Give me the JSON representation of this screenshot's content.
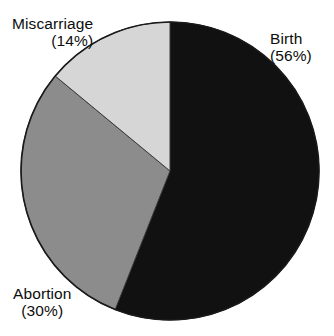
{
  "figure": {
    "background_color": "#ffffff",
    "outline_color": "#1a1a1a"
  },
  "chart_data": {
    "type": "pie",
    "title": "",
    "subtitle": "",
    "xlabel": "",
    "ylabel": "",
    "legend_position": "none",
    "grid": false,
    "start_angle_deg": 0,
    "direction": "clockwise",
    "categories": [
      "Birth",
      "Abortion",
      "Miscarriage"
    ],
    "values": [
      56,
      30,
      14
    ],
    "units": "percent",
    "total": 100,
    "slices": [
      {
        "label": "Birth",
        "value": 56,
        "percent_text": "(56%)",
        "color": "#111111",
        "start_deg": 0,
        "end_deg": 201.6
      },
      {
        "label": "Abortion",
        "value": 30,
        "percent_text": "(30%)",
        "color": "#8c8c8c",
        "start_deg": 201.6,
        "end_deg": 309.6
      },
      {
        "label": "Miscarriage",
        "value": 14,
        "percent_text": "(14%)",
        "color": "#d6d6d6",
        "start_deg": 309.6,
        "end_deg": 360
      }
    ],
    "annotations": [
      {
        "text": "Miscarriage",
        "secondary": "(14%)",
        "position": "top-left"
      },
      {
        "text": "Birth",
        "secondary": "(56%)",
        "position": "top-right"
      },
      {
        "text": "Abortion",
        "secondary": "(30%)",
        "position": "bottom-left"
      }
    ]
  },
  "labels": {
    "birth": {
      "name": "Birth",
      "pct": "(56%)"
    },
    "abortion": {
      "name": "Abortion",
      "pct": "(30%)"
    },
    "miscarriage": {
      "name": "Miscarriage",
      "pct": "(14%)"
    }
  }
}
